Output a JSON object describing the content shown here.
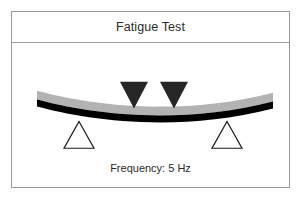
{
  "figure": {
    "title": "Fatigue Test",
    "caption": "Frequency: 5 Hz",
    "frame_border_color": "#9a9a9a",
    "background_color": "#ffffff",
    "text_color": "#2b2b2b"
  },
  "diagram": {
    "type": "four-point-bending-fatigue-test-schematic",
    "specimen": {
      "label": "specimen-beam",
      "upper_layer_color": "#b3b3b3",
      "lower_layer_color": "#000000",
      "deflection": "sagging",
      "left_end_x": 36,
      "right_end_x": 272,
      "center_sag_px": 10
    },
    "loading_heads": {
      "count": 2,
      "shape": "inverted-triangle",
      "color": "#262626",
      "left_center_x": 133,
      "right_center_x": 173,
      "width": 28,
      "height": 27
    },
    "motion_indicator": {
      "label": "cyclic-load-arrow",
      "shape": "vertical-double-headed-arrow",
      "color": "#ffffff",
      "center_x": 152,
      "top_y": 73,
      "bottom_y": 96
    },
    "supports": {
      "count": 2,
      "shape": "outline-triangle",
      "stroke_color": "#1a1a1a",
      "fill": "none",
      "left_apex_x": 78,
      "right_apex_x": 226,
      "apex_y": 110,
      "base_y": 137,
      "half_width": 15
    }
  }
}
